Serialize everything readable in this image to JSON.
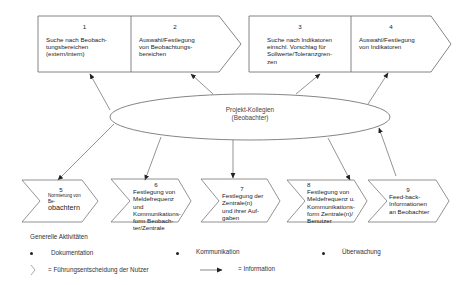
{
  "top_process": [
    {
      "number": "1",
      "text_lines": [
        "Suche nach Beobach-",
        "tungsbereichen",
        "(extern/intern)"
      ]
    },
    {
      "number": "2",
      "text_lines": [
        "Auswahl/Festlegung",
        "von Beobachtungs-",
        "bereichen"
      ]
    },
    {
      "number": "3",
      "text_lines": [
        "Suche nach Indikatoren",
        "einschl. Vorschlag für",
        "Sollwerte/Toleranzgren-",
        "zen"
      ]
    },
    {
      "number": "4",
      "text_lines": [
        "Auswahl/Festlegung",
        "von Indikatoren"
      ]
    }
  ],
  "center": {
    "line1": "Projekt-Kollegien",
    "line2": "(Beobachter)"
  },
  "bottom_steps": [
    {
      "number": "5",
      "text_lines_small": [
        "Normierung von",
        "Be-"
      ],
      "text_line_big": "obachtern"
    },
    {
      "number": "6",
      "text_lines": [
        "Festlegung von",
        "Meldefrequenz und",
        "Kommunikations-",
        "form Beobach-",
        "ter/Zentrale"
      ]
    },
    {
      "number": "7",
      "text_lines": [
        "Festlegung der",
        "Zentrale(n)",
        "und ihrer Auf-",
        "gaben"
      ]
    },
    {
      "number": "8",
      "text_lines": [
        "Festlegung von",
        "Meldefrequenz u.",
        "Kommunikations-",
        "form Zentrale(n)/",
        "Benutzer"
      ]
    },
    {
      "number": "9",
      "text_lines": [
        "Feed-back-",
        "Informationen",
        "an Beobachter"
      ]
    }
  ],
  "legend": {
    "title": "Generelle Aktivitäten",
    "items": [
      "Dokumentation",
      "Kommunikation",
      "Überwachung"
    ],
    "chevron_meaning": "= Führungsentscheidung der  Nutzer",
    "arrow_meaning": "= Information"
  },
  "colors": {
    "line": "#555555",
    "text": "#1c1c1c",
    "background": "#ffffff"
  }
}
